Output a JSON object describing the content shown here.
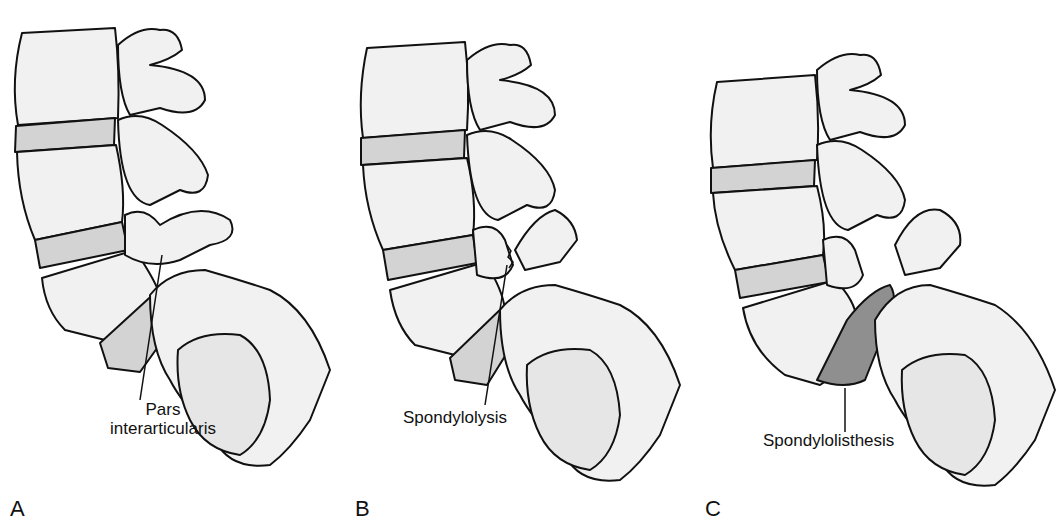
{
  "figure": {
    "panels": [
      {
        "letter": "A",
        "label_line1": "Pars",
        "label_line2": "interarticularis"
      },
      {
        "letter": "B",
        "label_line1": "Spondylolysis"
      },
      {
        "letter": "C",
        "label_line1": "Spondylolisthesis"
      }
    ],
    "colors": {
      "bone": "#f1f1f1",
      "disc": "#cfcfcf",
      "slip": "#8f8f8f",
      "outline": "#111111"
    }
  }
}
